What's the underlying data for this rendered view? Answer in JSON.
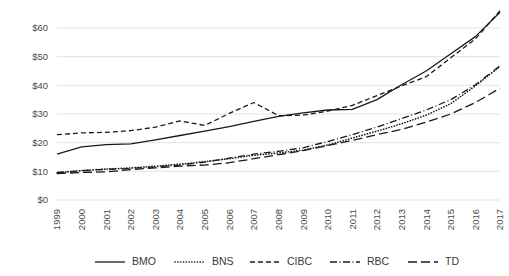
{
  "chart_data": {
    "type": "line",
    "title": "",
    "subtitle": "",
    "xlabel": "",
    "ylabel": "",
    "ylim": [
      0,
      65
    ],
    "yticks": [
      "$0",
      "$10",
      "$20",
      "$30",
      "$40",
      "$50",
      "$60"
    ],
    "ytick_values": [
      0,
      10,
      20,
      30,
      40,
      50,
      60
    ],
    "grid": "horizontal",
    "legend_position": "bottom",
    "x": [
      1999,
      2000,
      2001,
      2002,
      2003,
      2004,
      2005,
      2006,
      2007,
      2008,
      2009,
      2010,
      2011,
      2012,
      2013,
      2014,
      2015,
      2016,
      2017
    ],
    "categories": [
      "1999",
      "2000",
      "2001",
      "2002",
      "2003",
      "2004",
      "2005",
      "2006",
      "2007",
      "2008",
      "2009",
      "2010",
      "2011",
      "2012",
      "2013",
      "2014",
      "2015",
      "2016",
      "2017"
    ],
    "series": [
      {
        "name": "BMO",
        "style": "solid",
        "values": [
          16.0,
          18.5,
          19.3,
          19.6,
          21.0,
          22.5,
          24.0,
          25.6,
          27.4,
          29.2,
          30.4,
          31.4,
          31.6,
          35.0,
          40.2,
          45.0,
          51.0,
          57.0,
          65.5
        ]
      },
      {
        "name": "BNS",
        "style": "dotted",
        "values": [
          9.4,
          10.3,
          10.8,
          11.2,
          11.8,
          12.5,
          13.4,
          14.4,
          15.6,
          16.4,
          17.4,
          19.2,
          21.6,
          24.0,
          26.6,
          29.6,
          33.6,
          39.8,
          46.6
        ]
      },
      {
        "name": "CIBC",
        "style": "dashed",
        "values": [
          22.8,
          23.4,
          23.6,
          24.2,
          25.4,
          27.6,
          26.0,
          30.2,
          34.0,
          29.4,
          29.6,
          31.0,
          33.0,
          36.4,
          39.8,
          43.0,
          49.6,
          56.2,
          66.0
        ]
      },
      {
        "name": "RBC",
        "style": "dash-dot",
        "values": [
          9.6,
          10.2,
          10.7,
          11.0,
          11.6,
          12.2,
          13.2,
          14.6,
          16.0,
          17.0,
          18.2,
          20.4,
          22.8,
          25.4,
          28.4,
          31.4,
          35.0,
          40.2,
          46.8
        ]
      },
      {
        "name": "TD",
        "style": "long-dash",
        "values": [
          9.2,
          9.6,
          9.8,
          10.6,
          11.2,
          11.8,
          12.2,
          13.0,
          14.4,
          15.8,
          17.2,
          19.0,
          20.8,
          22.8,
          24.6,
          27.2,
          30.0,
          34.0,
          39.0
        ]
      }
    ]
  },
  "legend": {
    "items": [
      {
        "label": "BMO",
        "style": "solid"
      },
      {
        "label": "BNS",
        "style": "dotted"
      },
      {
        "label": "CIBC",
        "style": "dashed"
      },
      {
        "label": "RBC",
        "style": "dash-dot"
      },
      {
        "label": "TD",
        "style": "long-dash"
      }
    ]
  }
}
